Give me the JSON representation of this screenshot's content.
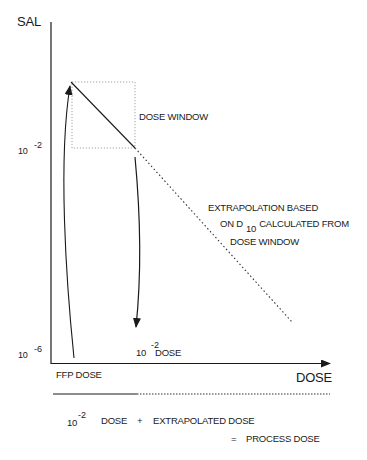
{
  "diagram": {
    "y_axis_label": "SAL",
    "x_axis_label": "DOSE",
    "y_ticks": [
      {
        "base": "10",
        "exp": "-2"
      },
      {
        "base": "10",
        "exp": "-6"
      }
    ],
    "dose_window_label": "DOSE WINDOW",
    "extrapolation_note": {
      "line1": "EXTRAPOLATION BASED",
      "line2_pre": "ON D",
      "line2_sub": "10",
      "line2_post": "CALCULATED FROM",
      "line3": "DOSE WINDOW"
    },
    "ffp_dose_label": "FFP DOSE",
    "target_dose_label": {
      "base": "10",
      "exp": "-2",
      "suffix": "DOSE"
    },
    "equation": {
      "term1_base": "10",
      "term1_exp": "-2",
      "term1_suffix": "DOSE",
      "plus": "+",
      "term2": "EXTRAPOLATED DOSE",
      "equals": "=",
      "result": "PROCESS DOSE"
    },
    "colors": {
      "ink": "#1a1a1a",
      "dotted_box": "#8a8a8a"
    }
  }
}
